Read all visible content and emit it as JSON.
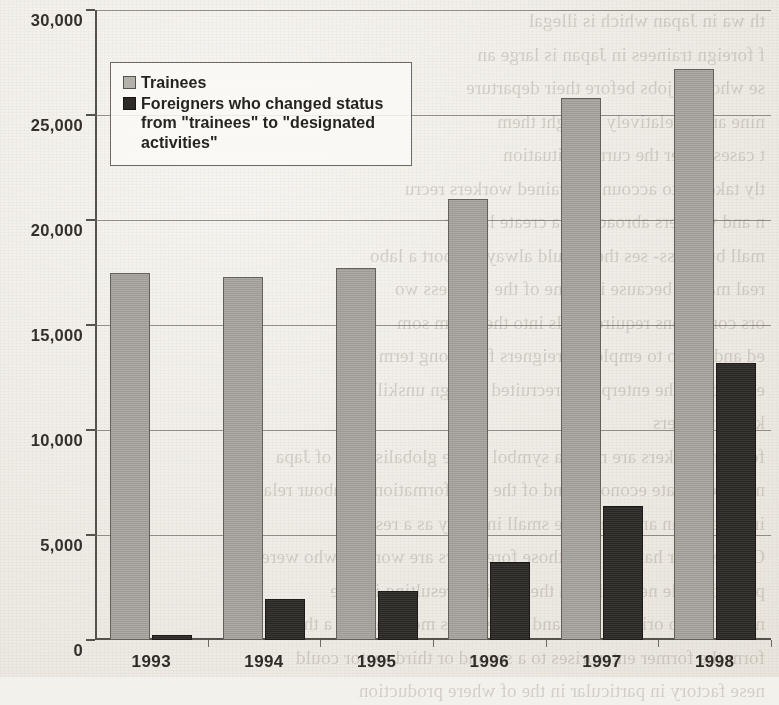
{
  "chart_data": {
    "type": "bar",
    "title": "",
    "subtitle": "",
    "xlabel": "",
    "ylabel": "",
    "categories": [
      "1993",
      "1994",
      "1995",
      "1996",
      "1997",
      "1998"
    ],
    "series": [
      {
        "name": "Trainees",
        "color": "#a5a29c",
        "values": [
          17500,
          17300,
          17700,
          21000,
          25800,
          27200
        ]
      },
      {
        "name": "Foreigners who changed status from \"trainees\" to \"designated activities\"",
        "color": "#2f2c29",
        "values": [
          250,
          1950,
          2350,
          3700,
          6400,
          13200
        ]
      }
    ],
    "ylim": [
      0,
      30000
    ],
    "ytick_values": [
      0,
      5000,
      10000,
      15000,
      20000,
      25000,
      30000
    ],
    "ytick_labels": [
      "0",
      "5,000",
      "10,000",
      "15,000",
      "20,000",
      "25,000",
      "30,000"
    ],
    "grid": true,
    "legend_position": "top-left"
  },
  "legend": {
    "items": [
      {
        "label": "Trainees",
        "swatch": "trainees"
      },
      {
        "label": "Foreigners who changed status from \"trainees\" to \"designated activities\"",
        "swatch": "changed"
      }
    ]
  },
  "background_text": {
    "lines": [
      "th  wa  in Japan which  is  illegal",
      "f foreign trainees in Japan is large an",
      "se who had jobs before their departure",
      "nine and a relatively brought them",
      "t cases under the current situation",
      "tly taken into account in trained workers recru",
      "n and workers abroad can a create  labour",
      "mall  business-  ses  they  could  always  import  a  labo",
      "real  market  because  in  some  of  the  business  wo",
      "ors  conditions  require  skills  into  their  firm  som",
      "ed  and  do  so  to  employ  foreigners  for  a  long  term  even",
      "es  force  in  the  enterprises  recruited  foreign  unskilled",
      "killed  workers",
      "foreign  workers  are  more  a  symbol  of  the  globalisation  of  Japa",
      "nese  corporate  economy  and  of  the  transformation  of  labour  relations",
      "in  Japan  than  another  more  small  industry  as  a  result",
      "On  the  other  hand  part  of  those  foreigners  are  workers  who  were  ex",
      "ploited  while  new  skills  in  the  previous  resulting  in  The",
      "not  return  to  original  jobs  and  some  cases  more  than  in  a  third",
      "form  the  former  enterprises  to  a  second  or  third  sector  could",
      "nese  factory  in  particular  in  the  of  where  production"
    ]
  }
}
